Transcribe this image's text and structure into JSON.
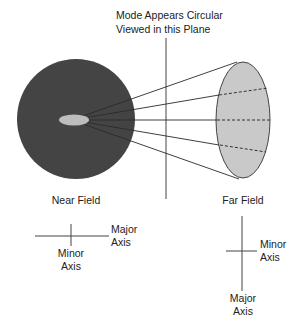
{
  "title": {
    "line1": "Mode Appears Circular",
    "line2": "Viewed in this Plane"
  },
  "near_field": {
    "label": "Near Field",
    "axes": {
      "major": {
        "line1": "Major",
        "line2": "Axis"
      },
      "minor": {
        "line1": "Minor",
        "line2": "Axis"
      }
    }
  },
  "far_field": {
    "label": "Far Field",
    "axes": {
      "major": {
        "line1": "Major",
        "line2": "Axis"
      },
      "minor": {
        "line1": "Minor",
        "line2": "Axis"
      }
    }
  },
  "colors": {
    "near_field_disk": "#444444",
    "mode_spot": "#bdbdbd",
    "far_field_ellipse": "#c9c9c9",
    "lines": "#333333"
  }
}
